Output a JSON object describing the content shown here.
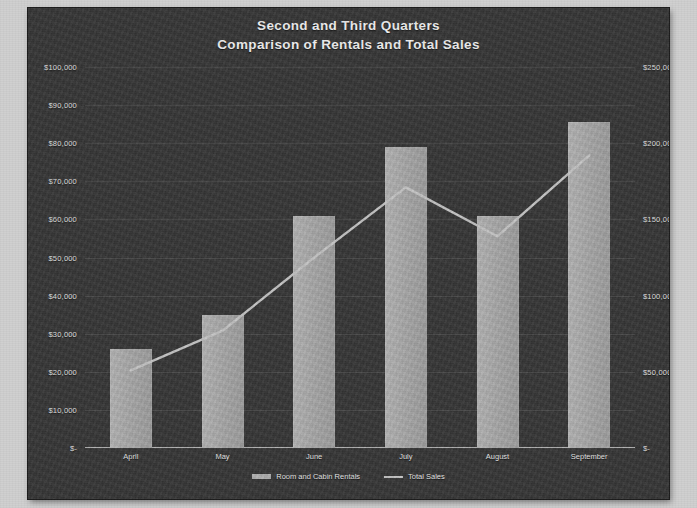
{
  "chart_data": {
    "type": "bar",
    "title": "Second and Third Quarters",
    "subtitle": "Comparison of Rentals and Total Sales",
    "categories": [
      "April",
      "May",
      "June",
      "July",
      "August",
      "September"
    ],
    "series": [
      {
        "name": "Room and Cabin Rentals",
        "type": "bar",
        "axis": "left",
        "values": [
          26000,
          35000,
          61000,
          79000,
          61000,
          85500
        ]
      },
      {
        "name": "Total Sales",
        "type": "line",
        "axis": "right",
        "values": [
          51000,
          77000,
          125000,
          171000,
          139000,
          192000
        ]
      }
    ],
    "xlabel": "",
    "ylabel": "",
    "ylim": [
      0,
      100000
    ],
    "y2lim": [
      0,
      250000
    ],
    "y_ticks": [
      "$-",
      "$10,000",
      "$20,000",
      "$30,000",
      "$40,000",
      "$50,000",
      "$60,000",
      "$70,000",
      "$80,000",
      "$90,000",
      "$100,000"
    ],
    "y_tick_values": [
      0,
      10000,
      20000,
      30000,
      40000,
      50000,
      60000,
      70000,
      80000,
      90000,
      100000
    ],
    "y2_ticks": [
      "$-",
      "$50,000",
      "$100,000",
      "$150,000",
      "$200,000",
      "$250,000"
    ],
    "y2_tick_values": [
      0,
      50000,
      100000,
      150000,
      200000,
      250000
    ],
    "grid": true,
    "legend_position": "bottom",
    "legend": [
      "Room and Cabin Rentals",
      "Total Sales"
    ],
    "colors": {
      "background": "#373737",
      "page": "#cfcfcf",
      "bar": "#a9a9a9",
      "line": "#c6c6c6",
      "text": "#e6e6e6",
      "grid": "#4a4a4a"
    }
  }
}
